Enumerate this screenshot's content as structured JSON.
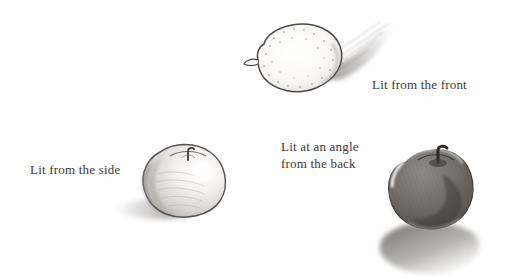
{
  "page": {
    "background_color": "#ffffff",
    "medium": "graphite pencil drawing"
  },
  "captions": {
    "front": "Lit from the front",
    "side": "Lit from the side",
    "back": "Lit at an angle\nfrom the back",
    "text_color": "#3b3a38"
  },
  "drawings": [
    {
      "id": "lemon",
      "subject": "lemon",
      "lighting": "front",
      "description": "lemon seen from the side with a small nub at left, pale interior with stippled dots, thin dark contour",
      "shadow_direction": "up and to the right, behind the object",
      "shadow_style": "fanned hatching",
      "outline_color": "#4a4846",
      "body_color": "#fbfaf7",
      "shade_color": "#8c8a87"
    },
    {
      "id": "apple-side",
      "subject": "apple",
      "lighting": "side",
      "description": "light apple with short stem in a top dimple, bright on the right, soft shading toward the lower left",
      "shadow_direction": "to the left of the object",
      "shadow_style": "soft horizontal smudge",
      "outline_color": "#55524f",
      "body_color": "#f2f0ec",
      "shade_color": "#9b9894"
    },
    {
      "id": "apple-back",
      "subject": "apple",
      "lighting": "angle from the back",
      "description": "dark apple in silhouette with a bright rim highlight along the upper left edge and a dark stem at the top",
      "shadow_direction": "toward the viewer, down and to the right",
      "shadow_style": "dense hatched ellipse",
      "outline_color": "#44413e",
      "body_color": "#6f6c69",
      "shade_color": "#3e3b39"
    }
  ]
}
